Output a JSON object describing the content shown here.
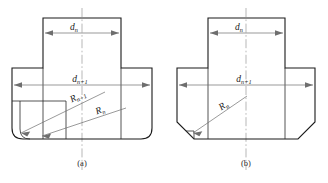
{
  "figure": {
    "type": "engineering-diagram",
    "panels": [
      {
        "id": "a",
        "caption": "(a)",
        "corner_style": "rounded",
        "dimensions": [
          {
            "name": "inner-diameter",
            "symbol": "d",
            "subscript": "n"
          },
          {
            "name": "outer-diameter",
            "symbol": "d",
            "subscript": "n+1"
          }
        ],
        "radii": [
          {
            "name": "outer-radius",
            "symbol": "R",
            "subscript": "n+1"
          },
          {
            "name": "inner-radius",
            "symbol": "R",
            "subscript": "n"
          }
        ]
      },
      {
        "id": "b",
        "caption": "(b)",
        "corner_style": "chamfered",
        "dimensions": [
          {
            "name": "inner-diameter",
            "symbol": "d",
            "subscript": "n"
          },
          {
            "name": "outer-diameter",
            "symbol": "d",
            "subscript": "n+1"
          }
        ],
        "radii": [
          {
            "name": "corner-radius",
            "symbol": "R",
            "subscript": "n"
          }
        ]
      }
    ],
    "colors": {
      "outline": "#1a1a1a",
      "dimension": "#6e6e6e",
      "centerline": "#9a9a9a",
      "background": "#ffffff"
    }
  }
}
